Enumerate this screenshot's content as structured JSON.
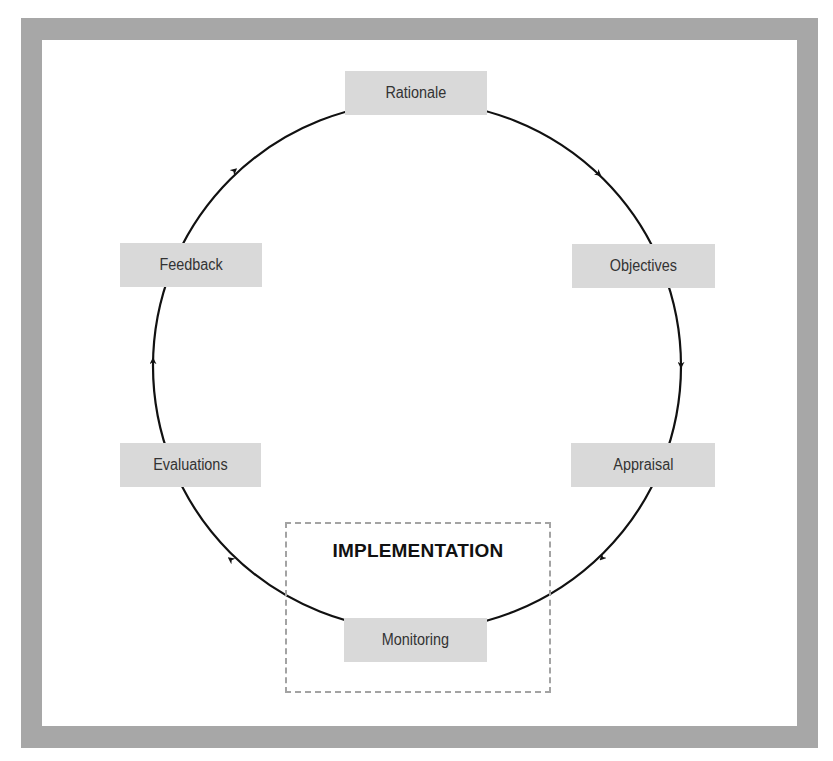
{
  "diagram": {
    "type": "cycle",
    "direction": "clockwise",
    "frame_color": "#a7a7a7",
    "box_color": "#d9d9d9",
    "stages": [
      {
        "id": "rationale",
        "label": "Rationale"
      },
      {
        "id": "objectives",
        "label": "Objectives"
      },
      {
        "id": "appraisal",
        "label": "Appraisal"
      },
      {
        "id": "monitoring",
        "label": "Monitoring"
      },
      {
        "id": "evaluations",
        "label": "Evaluations"
      },
      {
        "id": "feedback",
        "label": "Feedback"
      }
    ],
    "group": {
      "label": "IMPLEMENTATION",
      "contains": [
        "monitoring"
      ]
    },
    "edges": [
      {
        "from": "rationale",
        "to": "objectives"
      },
      {
        "from": "objectives",
        "to": "appraisal"
      },
      {
        "from": "appraisal",
        "to": "monitoring"
      },
      {
        "from": "monitoring",
        "to": "evaluations"
      },
      {
        "from": "evaluations",
        "to": "feedback"
      },
      {
        "from": "feedback",
        "to": "rationale"
      }
    ]
  }
}
